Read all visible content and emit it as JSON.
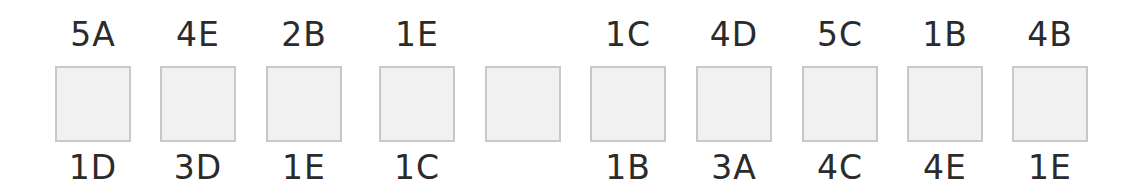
{
  "diagram": {
    "box_fill": "#f1f1f1",
    "box_border": "#c8c8c8",
    "cells": [
      {
        "top": "5A",
        "bottom": "1D"
      },
      {
        "top": "4E",
        "bottom": "3D"
      },
      {
        "top": "2B",
        "bottom": "1E"
      },
      {
        "top": "1E",
        "bottom": "1C"
      },
      {
        "top": "",
        "bottom": ""
      },
      {
        "top": "1C",
        "bottom": "1B"
      },
      {
        "top": "4D",
        "bottom": "3A"
      },
      {
        "top": "5C",
        "bottom": "4C"
      },
      {
        "top": "1B",
        "bottom": "4E"
      },
      {
        "top": "4B",
        "bottom": "1E"
      }
    ]
  }
}
